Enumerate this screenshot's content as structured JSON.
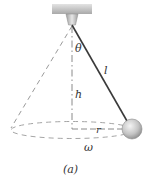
{
  "figure": {
    "caption": "(a)",
    "labels": {
      "theta": "θ",
      "length": "l",
      "height": "h",
      "radius": "r",
      "angular_velocity": "ω"
    }
  },
  "colors": {
    "ceiling_top": "#d4d4d4",
    "ceiling_bottom": "#a8a8a8",
    "mount": "#bdbdbd",
    "string": "#3a3a3a",
    "dashed": "#9a9a9a",
    "bob_light": "#f2f2f2",
    "bob_dark": "#8c8c8c"
  }
}
